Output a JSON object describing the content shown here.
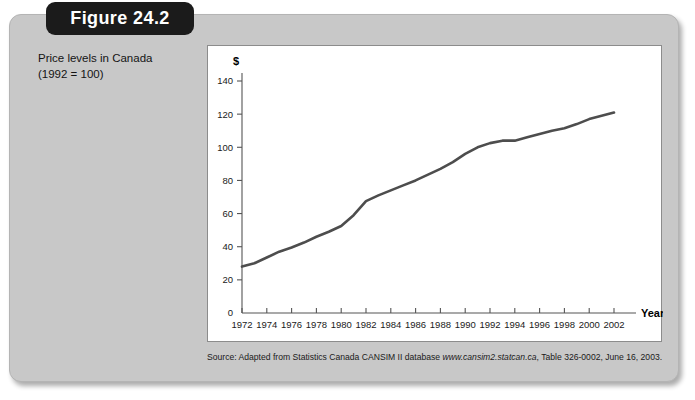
{
  "figure": {
    "tab_label": "Figure 24.2",
    "caption_line1": "Price levels in Canada",
    "caption_line2": "(1992 = 100)",
    "source_prefix": "Source: Adapted from Statistics Canada CANSIM II database ",
    "source_url": "www.cansim2.statcan.ca",
    "source_suffix": ", Table 326-0002, June 16, 2003."
  },
  "colors": {
    "panel_gray": "#c8c8c8",
    "tab_black": "#1b1b1b",
    "line_gray": "#4d4d4d",
    "axis_gray": "#555555",
    "plot_white": "#ffffff"
  },
  "chart_data": {
    "type": "line",
    "title": "Price levels in Canada (1992 = 100)",
    "xlabel": "Year",
    "ylabel": "$",
    "xlim": [
      1972,
      2002
    ],
    "ylim": [
      0,
      140
    ],
    "ytick_values": [
      0,
      20,
      40,
      60,
      80,
      100,
      120,
      140
    ],
    "xtick_labels": [
      "1972",
      "1974",
      "1976",
      "1978",
      "1980",
      "1982",
      "1984",
      "1986",
      "1988",
      "1990",
      "1992",
      "1994",
      "1996",
      "1998",
      "2000",
      "2002"
    ],
    "grid": false,
    "legend": null,
    "series": [
      {
        "name": "Consumer Price Index (1992 = 100)",
        "x": [
          1972,
          1973,
          1974,
          1975,
          1976,
          1977,
          1978,
          1979,
          1980,
          1981,
          1982,
          1983,
          1984,
          1985,
          1986,
          1987,
          1988,
          1989,
          1990,
          1991,
          1992,
          1993,
          1994,
          1995,
          1996,
          1997,
          1998,
          1999,
          2000,
          2001,
          2002
        ],
        "values": [
          28.0,
          30.0,
          33.5,
          37.0,
          39.5,
          42.5,
          46.0,
          49.0,
          52.5,
          59.0,
          67.5,
          71.0,
          74.0,
          77.0,
          80.0,
          83.5,
          87.0,
          91.0,
          96.0,
          100.0,
          102.5,
          104.0,
          104.0,
          106.0,
          108.0,
          110.0,
          111.5,
          114.0,
          117.0,
          119.0,
          121.0
        ]
      }
    ]
  }
}
